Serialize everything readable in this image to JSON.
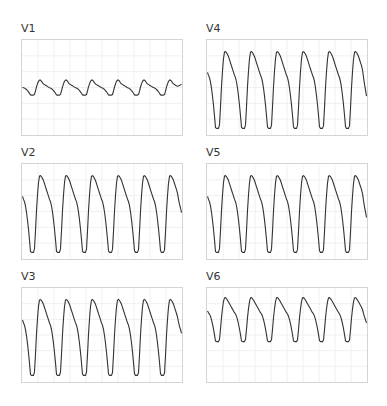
{
  "chart_data": {
    "type": "line",
    "title": "",
    "grid": true,
    "layout": "3 rows x 2 columns",
    "panels": [
      {
        "lead": "V1",
        "row": 0,
        "col": 0,
        "beats": 6,
        "baseline": 0.35,
        "amplitude_up": 0.18,
        "amplitude_down": 0.28,
        "polarity": "small-positive-deep-negative",
        "end_level": 0.4
      },
      {
        "lead": "V4",
        "row": 0,
        "col": 1,
        "beats": 6,
        "baseline": 0.55,
        "amplitude_up": 0.65,
        "amplitude_down": 0.9,
        "polarity": "tall",
        "end_level": 0.82
      },
      {
        "lead": "V2",
        "row": 1,
        "col": 0,
        "beats": 6,
        "baseline": 0.3,
        "amplitude_up": 0.7,
        "amplitude_down": 0.9,
        "polarity": "tall",
        "end_level": 0.62
      },
      {
        "lead": "V5",
        "row": 1,
        "col": 1,
        "beats": 6,
        "baseline": 0.45,
        "amplitude_up": 0.55,
        "amplitude_down": 0.85,
        "polarity": "tall",
        "end_level": 0.75
      },
      {
        "lead": "V3",
        "row": 2,
        "col": 0,
        "beats": 6,
        "baseline": 0.3,
        "amplitude_up": 0.72,
        "amplitude_down": 0.92,
        "polarity": "tall",
        "end_level": 0.55
      },
      {
        "lead": "V6",
        "row": 2,
        "col": 1,
        "beats": 6,
        "baseline": 0.25,
        "amplitude_up": 0.9,
        "amplitude_down": 0.55,
        "polarity": "upper-half",
        "end_level": 0.48
      }
    ]
  },
  "labels": {
    "v1": "V1",
    "v4": "V4",
    "v2": "V2",
    "v5": "V5",
    "v3": "V3",
    "v6": "V6"
  },
  "colors": {
    "trace": "#333333",
    "grid": "#f0f0f0",
    "border": "#d4d4d4"
  }
}
